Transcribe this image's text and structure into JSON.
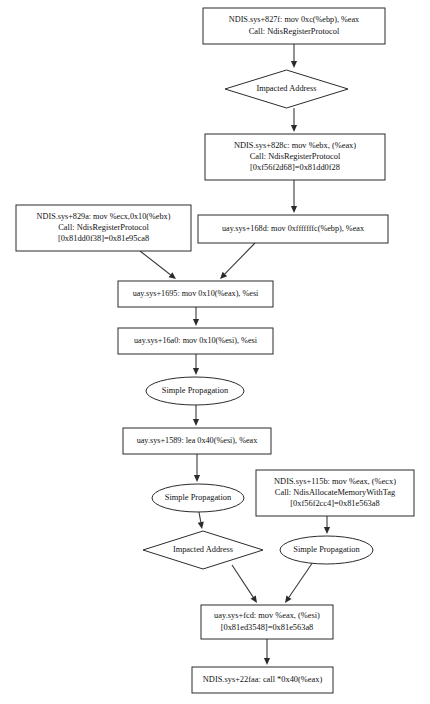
{
  "diagram": {
    "type": "flowchart",
    "background_color": "#ffffff",
    "node_fill": "#ffffff",
    "node_stroke": "#2b2b2b",
    "edge_color": "#3a3a3a",
    "nodes": [
      {
        "id": "n1",
        "shape": "rectangle",
        "name": "node-ndis-827f",
        "lines": [
          "NDIS.sys+827f: mov 0xc(%ebp), %eax",
          "Call: NdisRegisterProtocol"
        ],
        "x": 203,
        "y": 8,
        "w": 182,
        "h": 36
      },
      {
        "id": "n2",
        "shape": "diamond",
        "name": "node-impacted-address-1",
        "lines": [
          "Impacted Address"
        ],
        "x": 225,
        "y": 70,
        "w": 123,
        "h": 38
      },
      {
        "id": "n3",
        "shape": "rectangle",
        "name": "node-ndis-828c",
        "lines": [
          "NDIS.sys+828c: mov %ebx, (%eax)",
          "Call: NdisRegisterProtocol",
          "[0xf56f2d68]=0x81dd0f28"
        ],
        "x": 205,
        "y": 134,
        "w": 180,
        "h": 46
      },
      {
        "id": "n4",
        "shape": "rectangle",
        "name": "node-ndis-829a",
        "lines": [
          "NDIS.sys+829a: mov %ecx,0x10(%ebx)",
          "Call: NdisRegisterProtocol",
          "[0x81dd0f38]=0x81e95ca8"
        ],
        "x": 16,
        "y": 205,
        "w": 175,
        "h": 46
      },
      {
        "id": "n5",
        "shape": "rectangle",
        "name": "node-uay-168d",
        "lines": [
          "uay.sys+168d: mov 0xfffffffc(%ebp), %eax"
        ],
        "x": 198,
        "y": 215,
        "w": 190,
        "h": 28
      },
      {
        "id": "n6",
        "shape": "rectangle",
        "name": "node-uay-1695",
        "lines": [
          "uay.sys+1695: mov 0x10(%eax), %esi"
        ],
        "x": 118,
        "y": 281,
        "w": 155,
        "h": 26
      },
      {
        "id": "n7",
        "shape": "rectangle",
        "name": "node-uay-16a0",
        "lines": [
          "uay.sys+16a0: mov 0x10(%esi), %esi"
        ],
        "x": 118,
        "y": 328,
        "w": 155,
        "h": 26
      },
      {
        "id": "n8",
        "shape": "ellipse",
        "name": "node-simple-propagation-1",
        "lines": [
          "Simple Propagation"
        ],
        "x": 146,
        "y": 377,
        "w": 98,
        "h": 28
      },
      {
        "id": "n9",
        "shape": "rectangle",
        "name": "node-uay-1589",
        "lines": [
          "uay.sys+1589: lea 0x40(%esi), %eax"
        ],
        "x": 123,
        "y": 428,
        "w": 148,
        "h": 26
      },
      {
        "id": "n10",
        "shape": "ellipse",
        "name": "node-simple-propagation-2",
        "lines": [
          "Simple Propagation"
        ],
        "x": 152,
        "y": 484,
        "w": 92,
        "h": 28
      },
      {
        "id": "n11",
        "shape": "rectangle",
        "name": "node-ndis-115b",
        "lines": [
          "NDIS.sys+115b: mov %eax, (%ecx)",
          "Call: NdisAllocateMemoryWithTag",
          "[0xf56f2cc4]=0x81e563a8"
        ],
        "x": 256,
        "y": 470,
        "w": 158,
        "h": 46
      },
      {
        "id": "n12",
        "shape": "diamond",
        "name": "node-impacted-address-2",
        "lines": [
          "Impacted Address"
        ],
        "x": 143,
        "y": 531,
        "w": 120,
        "h": 38
      },
      {
        "id": "n13",
        "shape": "ellipse",
        "name": "node-simple-propagation-3",
        "lines": [
          "Simple Propagation"
        ],
        "x": 280,
        "y": 536,
        "w": 93,
        "h": 28
      },
      {
        "id": "n14",
        "shape": "rectangle",
        "name": "node-uay-fcd",
        "lines": [
          "uay.sys+fcd: mov %eax, (%esi)",
          "[0x81ed3548]=0x81e563a8"
        ],
        "x": 201,
        "y": 605,
        "w": 132,
        "h": 34
      },
      {
        "id": "n15",
        "shape": "rectangle",
        "name": "node-ndis-22faa",
        "lines": [
          "NDIS.sys+22faa: call *0x40(%eax)"
        ],
        "x": 192,
        "y": 667,
        "w": 141,
        "h": 26
      }
    ],
    "edges": [
      {
        "name": "edge-n1-n2",
        "from": "n1",
        "to": "n2",
        "points": [
          [
            294,
            44
          ],
          [
            294,
            68
          ]
        ]
      },
      {
        "name": "edge-n2-n3",
        "from": "n2",
        "to": "n3",
        "points": [
          [
            294,
            108
          ],
          [
            294,
            132
          ]
        ]
      },
      {
        "name": "edge-n3-n5",
        "from": "n3",
        "to": "n5",
        "points": [
          [
            294,
            180
          ],
          [
            294,
            213
          ]
        ]
      },
      {
        "name": "edge-n4-n6",
        "from": "n4",
        "to": "n6",
        "points": [
          [
            140,
            251
          ],
          [
            176,
            279
          ]
        ]
      },
      {
        "name": "edge-n5-n6",
        "from": "n5",
        "to": "n6",
        "points": [
          [
            255,
            243
          ],
          [
            220,
            279
          ]
        ]
      },
      {
        "name": "edge-n6-n7",
        "from": "n6",
        "to": "n7",
        "points": [
          [
            196,
            307
          ],
          [
            196,
            326
          ]
        ]
      },
      {
        "name": "edge-n7-n8",
        "from": "n7",
        "to": "n8",
        "points": [
          [
            196,
            354
          ],
          [
            196,
            375
          ]
        ]
      },
      {
        "name": "edge-n8-n9",
        "from": "n8",
        "to": "n9",
        "points": [
          [
            196,
            405
          ],
          [
            196,
            426
          ]
        ]
      },
      {
        "name": "edge-n9-n10",
        "from": "n9",
        "to": "n10",
        "points": [
          [
            197,
            454
          ],
          [
            197,
            482
          ]
        ]
      },
      {
        "name": "edge-n10-n12",
        "from": "n10",
        "to": "n12",
        "points": [
          [
            199,
            512
          ],
          [
            202,
            529
          ]
        ]
      },
      {
        "name": "edge-n11-n13",
        "from": "n11",
        "to": "n13",
        "points": [
          [
            327,
            516
          ],
          [
            327,
            534
          ]
        ]
      },
      {
        "name": "edge-n12-n14",
        "from": "n12",
        "to": "n14",
        "points": [
          [
            232,
            565
          ],
          [
            257,
            603
          ]
        ]
      },
      {
        "name": "edge-n13-n14",
        "from": "n13",
        "to": "n14",
        "points": [
          [
            313,
            562
          ],
          [
            285,
            603
          ]
        ]
      },
      {
        "name": "edge-n14-n15",
        "from": "n14",
        "to": "n15",
        "points": [
          [
            267,
            639
          ],
          [
            267,
            665
          ]
        ]
      }
    ]
  }
}
